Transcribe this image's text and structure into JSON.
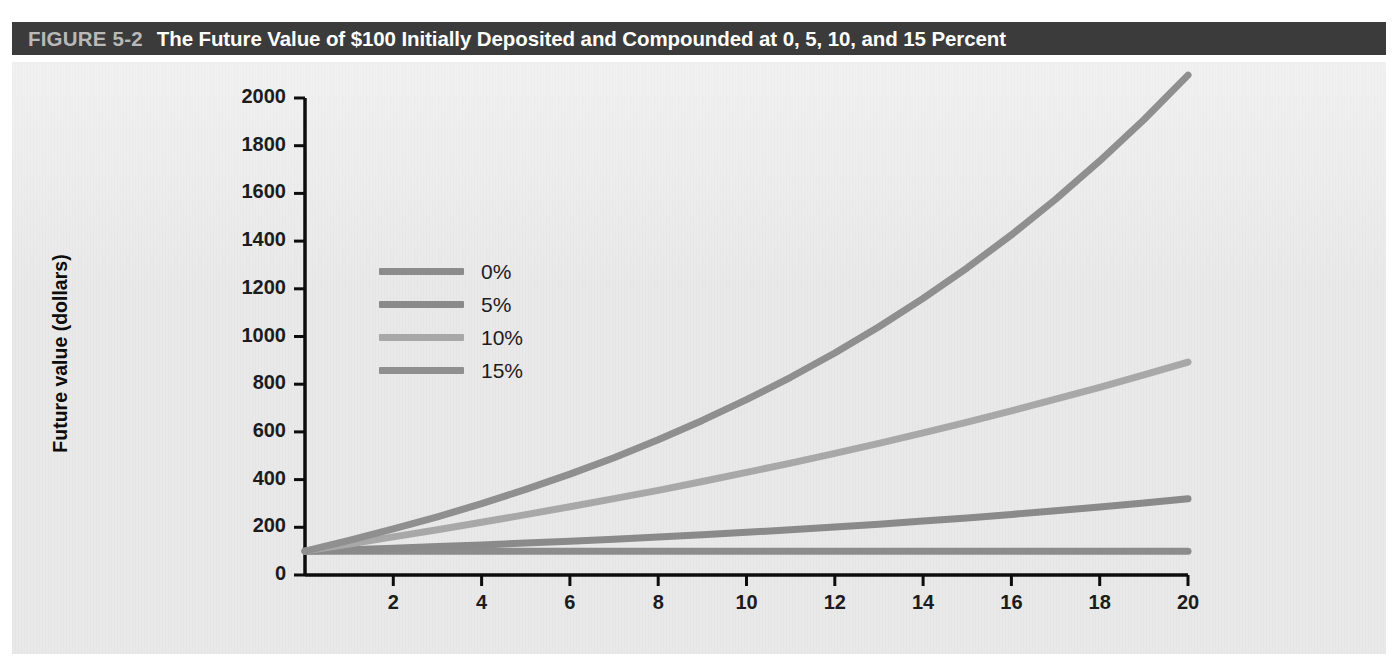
{
  "figure": {
    "number": "FIGURE 5-2",
    "title": "The Future Value of $100 Initially Deposited and Compounded at 0, 5, 10, and 15 Percent"
  },
  "colors": {
    "title_bar_bg": "#3b3b3b",
    "title_number": "#b9b9b9",
    "title_text": "#ffffff",
    "plate_bg": "#e9e9e9",
    "axis": "#0d0d0d",
    "series_0": "#8c8c8c",
    "series_5": "#8a8a8a",
    "series_10": "#a8a8a8",
    "series_15": "#8f8f8f"
  },
  "legend": {
    "entries": [
      {
        "label": "0%",
        "color": "#8c8c8c"
      },
      {
        "label": "5%",
        "color": "#8a8a8a"
      },
      {
        "label": "10%",
        "color": "#a8a8a8"
      },
      {
        "label": "15%",
        "color": "#8f8f8f"
      }
    ]
  },
  "chart_data": {
    "type": "line",
    "title": "The Future Value of $100 Initially Deposited and Compounded at 0, 5, 10, and 15 Percent",
    "xlabel": "Number of years",
    "ylabel": "Future value (dollars)",
    "xlim": [
      0,
      20
    ],
    "ylim": [
      0,
      2000
    ],
    "grid": false,
    "legend_position": "inside-upper-left",
    "xticks": [
      2,
      4,
      6,
      8,
      10,
      12,
      14,
      16,
      18,
      20
    ],
    "xtick_labels": [
      "2",
      "4",
      "6",
      "8",
      "10",
      "12",
      "14",
      "16",
      "18",
      "20"
    ],
    "yticks": [
      0,
      200,
      400,
      600,
      800,
      1000,
      1200,
      1400,
      1600,
      1800,
      2000
    ],
    "ytick_labels": [
      "0",
      "200",
      "400",
      "600",
      "800",
      "1000",
      "1200",
      "1400",
      "1600",
      "1800",
      "2000"
    ],
    "x": [
      0,
      1,
      2,
      3,
      4,
      5,
      6,
      7,
      8,
      9,
      10,
      11,
      12,
      13,
      14,
      15,
      16,
      17,
      18,
      19,
      20
    ],
    "series": [
      {
        "name": "0%",
        "color": "#8c8c8c",
        "values": [
          100,
          100,
          100,
          100,
          100,
          100,
          100,
          100,
          100,
          100,
          100,
          100,
          100,
          100,
          100,
          100,
          100,
          100,
          100,
          100,
          100
        ]
      },
      {
        "name": "5%",
        "color": "#8a8a8a",
        "values": [
          100,
          106,
          112,
          119,
          126,
          134,
          142,
          150,
          159,
          169,
          179,
          190,
          201,
          213,
          226,
          239,
          254,
          269,
          285,
          302,
          320
        ]
      },
      {
        "name": "10%",
        "color": "#a8a8a8",
        "values": [
          100,
          130,
          160,
          190,
          221,
          253,
          286,
          320,
          355,
          392,
          430,
          469,
          510,
          552,
          596,
          641,
          688,
          737,
          787,
          839,
          893
        ]
      },
      {
        "name": "15%",
        "color": "#8f8f8f",
        "values": [
          100,
          145,
          193,
          244,
          299,
          359,
          423,
          492,
          567,
          648,
          735,
          829,
          931,
          1041,
          1160,
          1288,
          1426,
          1575,
          1736,
          1909,
          2096
        ]
      }
    ]
  }
}
